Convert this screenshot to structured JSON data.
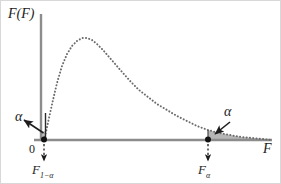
{
  "figure": {
    "width": 281,
    "height": 184,
    "background": "#ffffff",
    "frame_color": "#d8d8d8"
  },
  "labels": {
    "y_axis": "F(F)",
    "x_axis": "F",
    "origin": "0",
    "alpha_left": "α",
    "alpha_right": "α",
    "critical_left_base": "F",
    "critical_left_sub": "1−α",
    "critical_right_base": "F",
    "critical_right_sub": "α"
  },
  "colors": {
    "axis": "#8c8c8c",
    "curve": "#6b6b6b",
    "shade_fill": "#a9a9a9",
    "marker": "#111111",
    "arrow": "#1d1d1d",
    "text": "#1d1d1d"
  },
  "chart_data": {
    "type": "line",
    "title": "",
    "subtitle": "",
    "xlabel": "F",
    "ylabel": "F(F)",
    "grid": false,
    "legend": null,
    "line_style": "dotted",
    "axis_origin_px": {
      "x": 41,
      "y": 140
    },
    "axis_end_px": {
      "x": 272,
      "y": 140
    },
    "y_axis_top_px": 14,
    "xlim": [
      0,
      10
    ],
    "ylim": [
      0,
      1
    ],
    "x": [
      0.02,
      0.1,
      0.25,
      0.45,
      0.7,
      1.0,
      1.3,
      1.6,
      1.9,
      2.2,
      2.6,
      3.0,
      3.5,
      4.0,
      4.6,
      5.2,
      5.8,
      6.5,
      7.2,
      8.0,
      8.8,
      9.6,
      10.0
    ],
    "y": [
      0.0,
      0.12,
      0.42,
      0.72,
      0.92,
      1.0,
      0.97,
      0.89,
      0.79,
      0.69,
      0.57,
      0.47,
      0.37,
      0.3,
      0.23,
      0.18,
      0.145,
      0.115,
      0.092,
      0.072,
      0.058,
      0.048,
      0.044
    ],
    "curve_points_px": [
      [
        44,
        140
      ],
      [
        46,
        132
      ],
      [
        49,
        118
      ],
      [
        53,
        100
      ],
      [
        57,
        83
      ],
      [
        62,
        66
      ],
      [
        67,
        54
      ],
      [
        72,
        46
      ],
      [
        77,
        41
      ],
      [
        82,
        38
      ],
      [
        87,
        38
      ],
      [
        92,
        40
      ],
      [
        97,
        44
      ],
      [
        103,
        50
      ],
      [
        109,
        57
      ],
      [
        116,
        65
      ],
      [
        123,
        73
      ],
      [
        131,
        82
      ],
      [
        139,
        90
      ],
      [
        148,
        97
      ],
      [
        157,
        104
      ],
      [
        167,
        110
      ],
      [
        177,
        116
      ],
      [
        187,
        121
      ],
      [
        197,
        126
      ],
      [
        208,
        130
      ],
      [
        219,
        133
      ],
      [
        230,
        135
      ],
      [
        241,
        137
      ],
      [
        252,
        138
      ],
      [
        262,
        139
      ],
      [
        272,
        140
      ]
    ],
    "markers": [
      {
        "name": "F_1_minus_alpha",
        "label": "F₁₋α",
        "x_px": 44,
        "y_px": 140,
        "tail": "lower",
        "area": "alpha"
      },
      {
        "name": "F_alpha",
        "label": "Fα",
        "x_px": 208,
        "y_px": 140,
        "tail": "upper",
        "area": "alpha"
      }
    ],
    "shaded_regions": [
      {
        "name": "upper-tail-alpha",
        "from_px": 208,
        "to_px": 272,
        "fill": "#a9a9a9",
        "label": "α"
      },
      {
        "name": "lower-tail-alpha",
        "from_px": 41,
        "to_px": 46,
        "fill": "#a9a9a9",
        "label": "α"
      }
    ],
    "annotations": [
      {
        "name": "alpha-left",
        "text": "α",
        "x_px": 15,
        "y_px": 110,
        "arrow_to_px": [
          44,
          136
        ]
      },
      {
        "name": "alpha-right",
        "text": "α",
        "x_px": 224,
        "y_px": 105,
        "arrow_to_px": [
          216,
          133
        ]
      }
    ]
  }
}
